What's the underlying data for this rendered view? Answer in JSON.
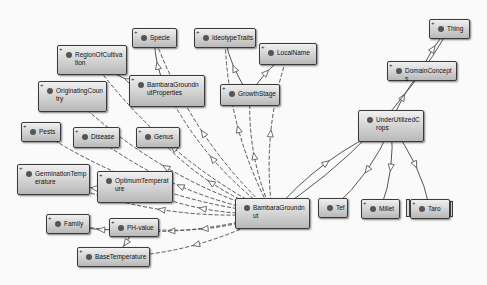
{
  "diagram": {
    "type": "ontology-graph",
    "nodes": [
      {
        "id": "specie",
        "label": "Specie",
        "x": 132,
        "y": 28,
        "w": 45,
        "h": 20,
        "plus": true
      },
      {
        "id": "ideotypetraits",
        "label": "IdeotypeTraits",
        "x": 194,
        "y": 28,
        "w": 62,
        "h": 20,
        "plus": true
      },
      {
        "id": "localname",
        "label": "LocalName",
        "x": 259,
        "y": 43,
        "w": 58,
        "h": 22,
        "plus": true
      },
      {
        "id": "regionofcultivation",
        "label": "RegionOfCultivation",
        "x": 57,
        "y": 45,
        "w": 70,
        "h": 30,
        "plus": true
      },
      {
        "id": "bambaragroundnutproperties",
        "label": "BambaraGroundnutProperties",
        "x": 129,
        "y": 75,
        "w": 76,
        "h": 32,
        "plus": true
      },
      {
        "id": "growthstage",
        "label": "GrowthStage",
        "x": 220,
        "y": 84,
        "w": 60,
        "h": 22,
        "plus": true
      },
      {
        "id": "originatingcountry",
        "label": "OriginatingCountry",
        "x": 38,
        "y": 81,
        "w": 69,
        "h": 31,
        "plus": true
      },
      {
        "id": "pests",
        "label": "Pests",
        "x": 21,
        "y": 122,
        "w": 40,
        "h": 20,
        "plus": true
      },
      {
        "id": "disease",
        "label": "Disease",
        "x": 73,
        "y": 127,
        "w": 47,
        "h": 21,
        "plus": true
      },
      {
        "id": "genus",
        "label": "Genus",
        "x": 136,
        "y": 127,
        "w": 44,
        "h": 21,
        "plus": true
      },
      {
        "id": "germinationtemperature",
        "label": "GerminationTemperature",
        "x": 17,
        "y": 164,
        "w": 73,
        "h": 31,
        "plus": true
      },
      {
        "id": "optimumtemperature",
        "label": "OptimumTemperature",
        "x": 97,
        "y": 171,
        "w": 76,
        "h": 32,
        "plus": true
      },
      {
        "id": "family",
        "label": "Family",
        "x": 46,
        "y": 214,
        "w": 44,
        "h": 20,
        "plus": true
      },
      {
        "id": "phvalue",
        "label": "PH-value",
        "x": 109,
        "y": 218,
        "w": 50,
        "h": 19,
        "plus": true
      },
      {
        "id": "basetemperature",
        "label": "BaseTemperature",
        "x": 77,
        "y": 247,
        "w": 73,
        "h": 20,
        "plus": true
      },
      {
        "id": "bambaragroundnut",
        "label": "BambaraGroundnut",
        "x": 235,
        "y": 198,
        "w": 75,
        "h": 31,
        "plus": false
      },
      {
        "id": "tef",
        "label": "Tef",
        "x": 318,
        "y": 198,
        "w": 30,
        "h": 20,
        "plus": false
      },
      {
        "id": "millet",
        "label": "Millet",
        "x": 361,
        "y": 199,
        "w": 39,
        "h": 20,
        "plus": true
      },
      {
        "id": "taro",
        "label": "Taro",
        "x": 410,
        "y": 199,
        "w": 40,
        "h": 20,
        "plus": true,
        "stack": true
      },
      {
        "id": "thing",
        "label": "Thing",
        "x": 429,
        "y": 19,
        "w": 41,
        "h": 20,
        "plus": true
      },
      {
        "id": "domainconcepts",
        "label": "DomainConcepts",
        "x": 387,
        "y": 61,
        "w": 70,
        "h": 20,
        "plus": true
      },
      {
        "id": "underutilizedcrops",
        "label": "UnderUtilizedCrops",
        "x": 358,
        "y": 110,
        "w": 66,
        "h": 32,
        "plus": false
      }
    ],
    "edges": [
      {
        "from": "bambaragroundnut",
        "to": "specie",
        "style": "dashed"
      },
      {
        "from": "bambaragroundnut",
        "to": "ideotypetraits",
        "style": "dashed"
      },
      {
        "from": "bambaragroundnut",
        "to": "localname",
        "style": "dashed"
      },
      {
        "from": "bambaragroundnut",
        "to": "regionofcultivation",
        "style": "dashed"
      },
      {
        "from": "bambaragroundnut",
        "to": "bambaragroundnutproperties",
        "style": "dashed"
      },
      {
        "from": "bambaragroundnut",
        "to": "growthstage",
        "style": "dashed"
      },
      {
        "from": "bambaragroundnut",
        "to": "originatingcountry",
        "style": "dashed"
      },
      {
        "from": "bambaragroundnut",
        "to": "pests",
        "style": "dashed"
      },
      {
        "from": "bambaragroundnut",
        "to": "disease",
        "style": "dashed"
      },
      {
        "from": "bambaragroundnut",
        "to": "genus",
        "style": "dashed"
      },
      {
        "from": "bambaragroundnut",
        "to": "germinationtemperature",
        "style": "dashed"
      },
      {
        "from": "bambaragroundnut",
        "to": "optimumtemperature",
        "style": "dashed"
      },
      {
        "from": "bambaragroundnut",
        "to": "family",
        "style": "dashed"
      },
      {
        "from": "bambaragroundnut",
        "to": "phvalue",
        "style": "dashed"
      },
      {
        "from": "bambaragroundnut",
        "to": "basetemperature",
        "style": "dashed"
      },
      {
        "from": "bambaragroundnut",
        "to": "underutilizedcrops",
        "style": "solid"
      },
      {
        "from": "underutilizedcrops",
        "to": "domainconcepts",
        "style": "solid"
      },
      {
        "from": "domainconcepts",
        "to": "thing",
        "style": "solid"
      },
      {
        "from": "underutilizedcrops",
        "to": "tef",
        "style": "solid"
      },
      {
        "from": "underutilizedcrops",
        "to": "millet",
        "style": "solid"
      },
      {
        "from": "underutilizedcrops",
        "to": "taro",
        "style": "solid"
      },
      {
        "from": "thing",
        "to": "bambaragroundnut",
        "style": "solid"
      },
      {
        "from": "bambaragroundnutproperties",
        "to": "regionofcultivation",
        "style": "solid"
      },
      {
        "from": "bambaragroundnutproperties",
        "to": "specie",
        "style": "solid"
      },
      {
        "from": "growthstage",
        "to": "ideotypetraits",
        "style": "solid"
      },
      {
        "from": "growthstage",
        "to": "localname",
        "style": "solid"
      },
      {
        "from": "optimumtemperature",
        "to": "germinationtemperature",
        "style": "solid"
      },
      {
        "from": "phvalue",
        "to": "family",
        "style": "solid"
      },
      {
        "from": "phvalue",
        "to": "basetemperature",
        "style": "solid"
      }
    ],
    "colors": {
      "node_border": "#3a3a3a",
      "edge": "#555555",
      "background": "#fafafa"
    }
  }
}
